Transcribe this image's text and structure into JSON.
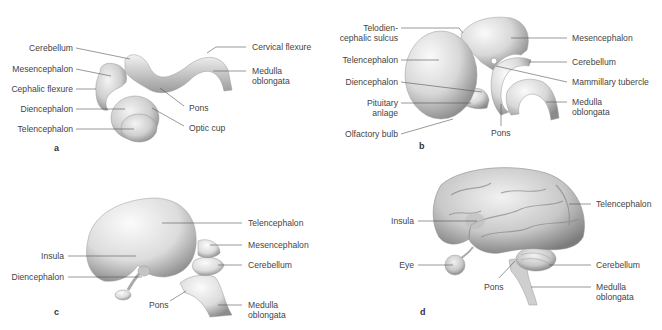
{
  "figure": {
    "panels": [
      {
        "id": "a",
        "letter": "a",
        "labels_left": [
          "Cerebellum",
          "Mesencephalon",
          "Cephalic flexure",
          "Diencephalon",
          "Telencephalon"
        ],
        "labels_right": [
          "Cervical flexure",
          "Medulla",
          "oblongata",
          "Pons",
          "Optic cup"
        ]
      },
      {
        "id": "b",
        "letter": "b",
        "labels_left": [
          "Telodien-",
          "cephalic sulcus",
          "Telencephalon",
          "Diencephalon",
          "Pituitary",
          "anlage",
          "Olfactory bulb"
        ],
        "labels_right": [
          "Mesencephalon",
          "Cerebellum",
          "Mammillary tubercle",
          "Medulla",
          "oblongata"
        ],
        "labels_bottom": [
          "Pons"
        ]
      },
      {
        "id": "c",
        "letter": "c",
        "labels_left": [
          "Insula",
          "Diencephalon"
        ],
        "labels_right": [
          "Telencephalon",
          "Mesencephalon",
          "Cerebellum",
          "Medulla",
          "oblongata"
        ],
        "labels_bottom": [
          "Pons"
        ]
      },
      {
        "id": "d",
        "letter": "d",
        "labels_left": [
          "Insula",
          "Eye"
        ],
        "labels_right": [
          "Telencephalon",
          "Cerebellum",
          "Medulla",
          "oblongata"
        ],
        "labels_bottom": [
          "Pons"
        ]
      }
    ]
  }
}
